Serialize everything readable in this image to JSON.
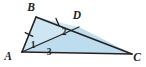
{
  "figure": {
    "type": "geometry-diagram",
    "canvas": {
      "width": 146,
      "height": 67
    },
    "colors": {
      "stroke": "#231f20",
      "label": "#231f20",
      "fill_upper": "#cde6f2",
      "fill_lower": "#bdddef",
      "tick": "#231f20",
      "background": "#ffffff"
    },
    "vertices": [
      {
        "id": "A",
        "label": "A",
        "x": 22,
        "y": 52,
        "label_x": 8,
        "label_y": 60
      },
      {
        "id": "B",
        "label": "B",
        "x": 36,
        "y": 17,
        "label_x": 31,
        "label_y": 11
      },
      {
        "id": "C",
        "label": "C",
        "x": 132,
        "y": 54,
        "label_x": 135,
        "label_y": 61
      },
      {
        "id": "D",
        "label": "D",
        "x": 79,
        "y": 27,
        "label_x": 75,
        "label_y": 19
      }
    ],
    "segments": [
      {
        "id": "AB",
        "from": "A",
        "to": "B",
        "ticks": 1
      },
      {
        "id": "BC",
        "from": "B",
        "to": "C",
        "ticks": 0
      },
      {
        "id": "AC",
        "from": "A",
        "to": "C",
        "ticks": 0
      },
      {
        "id": "AD",
        "from": "A",
        "to": "D",
        "ticks": 0
      },
      {
        "id": "BD",
        "from": "B",
        "to": "D",
        "ticks": 1
      }
    ],
    "angle_labels": [
      {
        "id": "1",
        "label": "1",
        "at_vertex": "A",
        "name": "angle-BAD",
        "x": 33,
        "y": 45
      },
      {
        "id": "2",
        "label": "2",
        "at_vertex": "D",
        "name": "angle-ADB",
        "x": 64,
        "y": 33
      },
      {
        "id": "3",
        "label": "3",
        "at_vertex": "A",
        "name": "angle-DAC",
        "x": 48,
        "y": 54
      }
    ],
    "regions": [
      {
        "id": "ABD",
        "name": "triangle-ABD",
        "fill": "#cde6f2"
      },
      {
        "id": "ADC",
        "name": "triangle-ADC",
        "fill": "#bdddef"
      }
    ]
  }
}
